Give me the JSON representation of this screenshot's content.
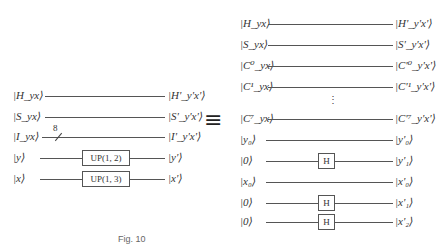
{
  "left_circuit": {
    "rows": [
      {
        "in": "|H_yx⟩",
        "out": "|H'_y'x'⟩",
        "gate": null
      },
      {
        "in": "|S_yx⟩",
        "out": "|S'_y'x'⟩",
        "gate": null
      },
      {
        "in": "|I_yx⟩",
        "out": "|I'_y'x'⟩",
        "gate": null,
        "bus_label": "8"
      },
      {
        "in": "|y⟩",
        "out": "|y'⟩",
        "gate": "UP(1, 2)"
      },
      {
        "in": "|x⟩",
        "out": "|x'⟩",
        "gate": "UP(1, 3)"
      }
    ]
  },
  "equivalence_symbol": "≡",
  "right_circuit": {
    "rows": [
      {
        "in": "|H_yx⟩",
        "out": "|H'_y'x'⟩",
        "gate": null
      },
      {
        "in": "|S_yx⟩",
        "out": "|S'_y'x'⟩",
        "gate": null
      },
      {
        "in": "|C⁰_yx⟩",
        "out": "|C'⁰_y'x'⟩",
        "gate": null
      },
      {
        "in": "|C¹_yx⟩",
        "out": "|C'¹_y'x'⟩",
        "gate": null
      },
      {
        "in": "|C⁷_yx⟩",
        "out": "|C'⁷_y'x'⟩",
        "gate": null
      },
      {
        "in": "|y₀⟩",
        "out": "|y'₀⟩",
        "gate": null
      },
      {
        "in": "|0⟩",
        "out": "|y'₁⟩",
        "gate": "H"
      },
      {
        "in": "|x₀⟩",
        "out": "|x'₀⟩",
        "gate": null
      },
      {
        "in": "|0⟩",
        "out": "|x'₁⟩",
        "gate": "H"
      },
      {
        "in": "|0⟩",
        "out": "|x'₂⟩",
        "gate": "H"
      }
    ],
    "ellipsis": "⋮"
  },
  "caption": "Fig. 10"
}
